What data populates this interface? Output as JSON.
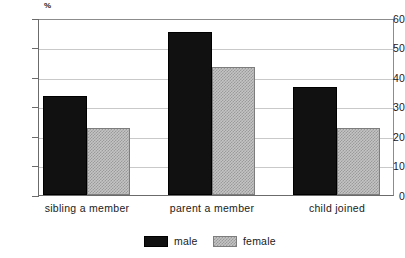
{
  "chart_data": {
    "type": "bar",
    "title": "",
    "subtitle": "",
    "xlabel": "",
    "ylabel": "%",
    "unit_symbol": "%",
    "categories": [
      "sibling a member",
      "parent a member",
      "child joined"
    ],
    "series": [
      {
        "name": "male",
        "color": "#111111",
        "values": [
          34,
          56,
          37
        ]
      },
      {
        "name": "female",
        "color": "#c4c4c4",
        "values": [
          23,
          44,
          23
        ]
      }
    ],
    "ylim": [
      0,
      60
    ],
    "ytick_step": 10,
    "yticks": [
      60,
      50,
      40,
      30,
      20,
      10,
      0
    ],
    "ytick_labels": [
      "60",
      "50",
      "40",
      "30",
      "20",
      "10",
      "0"
    ],
    "grid": true,
    "grid_axis": "y",
    "legend_position": "bottom-center",
    "legend": [
      "male",
      "female"
    ],
    "bar_group_gap": true,
    "annotations": []
  },
  "legend": {
    "items": [
      {
        "label": "male",
        "swatch": "solid-black-swatch"
      },
      {
        "label": "female",
        "swatch": "hatched-gray-swatch"
      }
    ]
  },
  "axes": {
    "y_unit_label": "%",
    "y_tick_labels": [
      "60",
      "50",
      "40",
      "30",
      "20",
      "10",
      "0"
    ],
    "x_tick_labels": [
      "sibling a member",
      "parent a member",
      "child joined"
    ]
  }
}
